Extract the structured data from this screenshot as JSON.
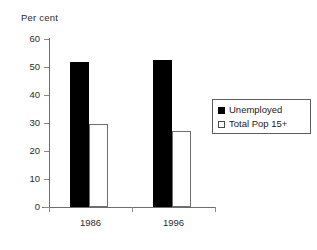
{
  "chart_data": {
    "type": "bar",
    "title": "",
    "xlabel": "",
    "ylabel": "Per cent",
    "categories": [
      "1986",
      "1996"
    ],
    "series": [
      {
        "name": "Unemployed",
        "values": [
          51.8,
          52.6
        ],
        "color": "#000000",
        "fill": "solid"
      },
      {
        "name": "Total Pop 15+",
        "values": [
          29.6,
          27.1
        ],
        "color": "#ffffff",
        "fill": "hollow"
      }
    ],
    "ylim": [
      0,
      60
    ],
    "yticks": [
      0,
      10,
      20,
      30,
      40,
      50,
      60
    ],
    "ytick_labels": [
      "0",
      "10",
      "20",
      "30",
      "40",
      "50",
      "60"
    ],
    "grid": false,
    "legend_position": "right"
  },
  "legend": {
    "entries": [
      {
        "label": "Unemployed"
      },
      {
        "label": "Total Pop 15+"
      }
    ]
  },
  "axes": {
    "y_title": "Per cent"
  }
}
